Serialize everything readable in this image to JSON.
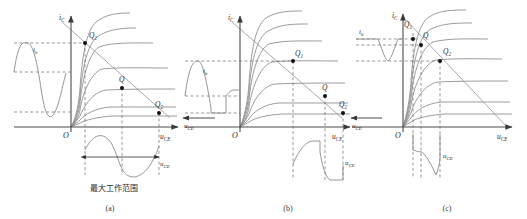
{
  "figure": {
    "type": "diagram",
    "panels": [
      {
        "id": "a",
        "caption": "(a)",
        "axis_y_label": "i",
        "axis_y_sub": "C",
        "axis_x_label": "u",
        "axis_x_sub": "CE",
        "origin_label": "O",
        "input_wave_label": "i",
        "input_wave_sub": "b",
        "output_wave_label": "u",
        "output_wave_sub": "CE",
        "q_points": [
          {
            "name": "Q",
            "sub": "1"
          },
          {
            "name": "Q",
            "sub": ""
          },
          {
            "name": "Q",
            "sub": "2"
          }
        ],
        "range_annotation": "最大工作范围",
        "input_wave_shape": "sine-undistorted",
        "output_wave_shape": "sine-undistorted"
      },
      {
        "id": "b",
        "caption": "(b)",
        "axis_y_label": "i",
        "axis_y_sub": "C",
        "axis_x_label": "u",
        "axis_x_sub": "CE",
        "origin_label": "O",
        "input_wave_label": "i",
        "input_wave_sub": "b",
        "input_wave_axis_label": "u",
        "input_wave_axis_sub": "CE",
        "output_wave_label": "u",
        "output_wave_sub": "CE",
        "q_points": [
          {
            "name": "Q",
            "sub": "1"
          },
          {
            "name": "Q",
            "sub": ""
          },
          {
            "name": "Q",
            "sub": "2"
          }
        ],
        "input_wave_shape": "clipped-bottom",
        "output_wave_shape": "clipped-saturation"
      },
      {
        "id": "c",
        "caption": "(c)",
        "axis_y_label": "i",
        "axis_y_sub": "C",
        "axis_x_label": "u",
        "axis_x_sub": "CE",
        "origin_label": "O",
        "input_wave_label": "i",
        "input_wave_sub": "b",
        "input_wave_axis_label": "u",
        "input_wave_axis_sub": "CE",
        "output_wave_label": "u",
        "output_wave_sub": "CE",
        "q_points": [
          {
            "name": "Q",
            "sub": "1"
          },
          {
            "name": "Q",
            "sub": ""
          },
          {
            "name": "Q",
            "sub": "2"
          }
        ],
        "input_wave_shape": "clipped-top",
        "output_wave_shape": "clipped-cutoff"
      }
    ],
    "colors": {
      "curve": "#8a8a8a",
      "axis": "#4a4a4a",
      "dashed": "#6b6b6b",
      "loadline": "#9a9a9a",
      "point": "#111111",
      "text": "#2b2b2b",
      "background": "#ffffff"
    }
  }
}
